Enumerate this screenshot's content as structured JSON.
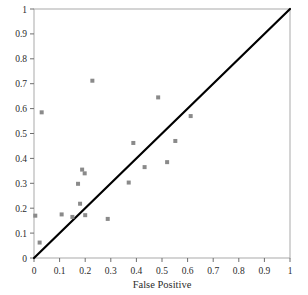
{
  "chart_data": {
    "type": "scatter",
    "title": "",
    "subtitle": "",
    "xlabel": "False Positive",
    "ylabel": "",
    "xlim": [
      0,
      1
    ],
    "ylim": [
      0,
      1
    ],
    "grid": false,
    "legend": null,
    "marker": {
      "shape": "square",
      "color": "#8a8a8a",
      "size_px": 4
    },
    "xticks": [
      0,
      0.1,
      0.2,
      0.3,
      0.4,
      0.5,
      0.6,
      0.7,
      0.8,
      0.9,
      1
    ],
    "xticklabels": [
      "0",
      "0.1",
      "0.2",
      "0.3",
      "0.4",
      "0.5",
      "0.6",
      "0.7",
      "0.8",
      "0.9",
      "1"
    ],
    "yticks": [
      0,
      0.1,
      0.2,
      0.3,
      0.4,
      0.5,
      0.6,
      0.7,
      0.8,
      0.9,
      1
    ],
    "yticklabels": [
      "0",
      "0.1",
      "0.2",
      "0.3",
      "0.4",
      "0.5",
      "0.6",
      "0.7",
      "0.8",
      "0.9",
      "1"
    ],
    "reference_line": {
      "name": "diagonal",
      "from": [
        0,
        0
      ],
      "to": [
        1,
        1
      ],
      "color": "#000000",
      "width_px": 2.2
    },
    "points": [
      {
        "x": 0.005,
        "y": 0.17
      },
      {
        "x": 0.022,
        "y": 0.062
      },
      {
        "x": 0.03,
        "y": 0.585
      },
      {
        "x": 0.108,
        "y": 0.175
      },
      {
        "x": 0.15,
        "y": 0.165
      },
      {
        "x": 0.172,
        "y": 0.298
      },
      {
        "x": 0.18,
        "y": 0.218
      },
      {
        "x": 0.188,
        "y": 0.355
      },
      {
        "x": 0.198,
        "y": 0.34
      },
      {
        "x": 0.2,
        "y": 0.172
      },
      {
        "x": 0.228,
        "y": 0.712
      },
      {
        "x": 0.288,
        "y": 0.157
      },
      {
        "x": 0.37,
        "y": 0.303
      },
      {
        "x": 0.388,
        "y": 0.462
      },
      {
        "x": 0.432,
        "y": 0.365
      },
      {
        "x": 0.485,
        "y": 0.645
      },
      {
        "x": 0.52,
        "y": 0.385
      },
      {
        "x": 0.552,
        "y": 0.47
      },
      {
        "x": 0.612,
        "y": 0.57
      }
    ]
  },
  "axes": {
    "frame_color": "#a9a9a9",
    "tick_color": "#6e6e6e",
    "background": "#ffffff"
  }
}
